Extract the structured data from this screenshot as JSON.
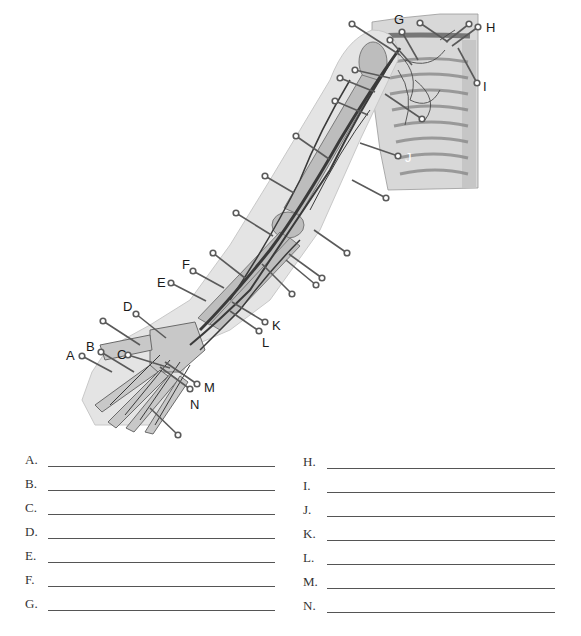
{
  "figure": {
    "callout_labels": [
      {
        "letter": "A",
        "x": 66,
        "y": 349
      },
      {
        "letter": "B",
        "x": 86,
        "y": 340
      },
      {
        "letter": "C",
        "x": 117,
        "y": 348
      },
      {
        "letter": "D",
        "x": 123,
        "y": 300
      },
      {
        "letter": "E",
        "x": 157,
        "y": 276
      },
      {
        "letter": "F",
        "x": 182,
        "y": 258
      },
      {
        "letter": "G",
        "x": 394,
        "y": 13
      },
      {
        "letter": "H",
        "x": 486,
        "y": 21
      },
      {
        "letter": "I",
        "x": 483,
        "y": 80
      },
      {
        "letter": "J",
        "x": 405,
        "y": 151
      },
      {
        "letter": "K",
        "x": 272,
        "y": 319
      },
      {
        "letter": "L",
        "x": 262,
        "y": 336
      },
      {
        "letter": "M",
        "x": 204,
        "y": 381
      },
      {
        "letter": "N",
        "x": 190,
        "y": 398
      }
    ]
  },
  "answers": {
    "left": [
      {
        "letter": "A.",
        "value": ""
      },
      {
        "letter": "B.",
        "value": ""
      },
      {
        "letter": "C.",
        "value": ""
      },
      {
        "letter": "D.",
        "value": ""
      },
      {
        "letter": "E.",
        "value": ""
      },
      {
        "letter": "F.",
        "value": ""
      },
      {
        "letter": "G.",
        "value": ""
      }
    ],
    "right": [
      {
        "letter": "H.",
        "value": ""
      },
      {
        "letter": "I.",
        "value": ""
      },
      {
        "letter": "J.",
        "value": ""
      },
      {
        "letter": "K.",
        "value": ""
      },
      {
        "letter": "L.",
        "value": ""
      },
      {
        "letter": "M.",
        "value": ""
      },
      {
        "letter": "N.",
        "value": ""
      }
    ]
  }
}
